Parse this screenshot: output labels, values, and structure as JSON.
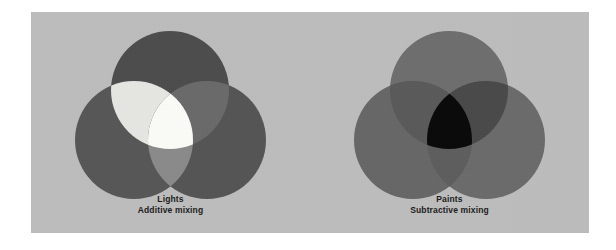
{
  "figure": {
    "plate_color": "#bdbdbd",
    "page_background": "#ffffff",
    "caption_color": "#1b1b1b"
  },
  "diagrams": [
    {
      "id": "additive",
      "caption_title": "Lights",
      "caption_subtitle": "Additive mixing",
      "circles": [
        {
          "name": "top-circle",
          "cx": 139,
          "cy": 78,
          "r": 59,
          "fill": "#4d4d4d"
        },
        {
          "name": "left-circle",
          "cx": 103,
          "cy": 128,
          "r": 59,
          "fill": "#575757"
        },
        {
          "name": "right-circle",
          "cx": 176,
          "cy": 128,
          "r": 59,
          "fill": "#555555"
        }
      ],
      "overlaps": [
        {
          "name": "top-left-overlap",
          "fill": "#e6e6e3"
        },
        {
          "name": "top-right-overlap",
          "fill": "#6a6a6a"
        },
        {
          "name": "left-right-overlap",
          "fill": "#8a8a8a"
        },
        {
          "name": "center-overlap",
          "fill": "#fbfbf8"
        }
      ]
    },
    {
      "id": "subtractive",
      "caption_title": "Paints",
      "caption_subtitle": "Subtractive mixing",
      "circles": [
        {
          "name": "top-circle",
          "cx": 139,
          "cy": 78,
          "r": 59,
          "fill": "#6e6e6e"
        },
        {
          "name": "left-circle",
          "cx": 103,
          "cy": 128,
          "r": 59,
          "fill": "#676767"
        },
        {
          "name": "right-circle",
          "cx": 176,
          "cy": 128,
          "r": 59,
          "fill": "#6b6b6b"
        }
      ],
      "overlaps": [
        {
          "name": "top-left-overlap",
          "fill": "#5a5a5a"
        },
        {
          "name": "top-right-overlap",
          "fill": "#4a4a4a"
        },
        {
          "name": "left-right-overlap",
          "fill": "#5e5e5e"
        },
        {
          "name": "center-overlap",
          "fill": "#0a0a0a"
        }
      ]
    }
  ]
}
